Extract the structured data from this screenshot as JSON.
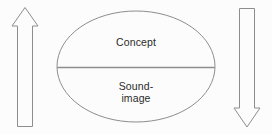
{
  "diagram": {
    "background_color": "#fcfcfc",
    "stroke_color": "#8d8d8d",
    "text_color": "#2b2b2b",
    "ellipse": {
      "upper_label": "Concept",
      "lower_label": "Sound-\nimage",
      "divider": "horizontal-divider"
    },
    "arrows": [
      {
        "name": "left-arrow-up",
        "direction": "up",
        "label": ""
      },
      {
        "name": "right-arrow-down",
        "direction": "down",
        "label": ""
      }
    ]
  }
}
